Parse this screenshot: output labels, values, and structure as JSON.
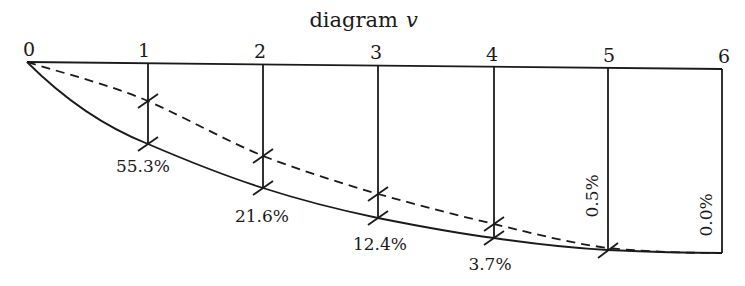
{
  "title": {
    "text": "diagram",
    "variable": "v"
  },
  "stations": [
    "0",
    "1",
    "2",
    "3",
    "4",
    "5",
    "6"
  ],
  "percentages": [
    {
      "station": "1",
      "label": "55.3%",
      "orientation": "horizontal"
    },
    {
      "station": "2",
      "label": "21.6%",
      "orientation": "horizontal"
    },
    {
      "station": "3",
      "label": "12.4%",
      "orientation": "horizontal"
    },
    {
      "station": "4",
      "label": "3.7%",
      "orientation": "horizontal"
    },
    {
      "station": "5",
      "label": "0.5%",
      "orientation": "vertical"
    },
    {
      "station": "6",
      "label": "0.0%",
      "orientation": "vertical"
    }
  ],
  "curves": [
    {
      "name": "solid-curve",
      "style": "solid"
    },
    {
      "name": "dashed-curve",
      "style": "dashed"
    }
  ],
  "colors": {
    "ink": "#1a1a1a",
    "background": "#ffffff"
  }
}
